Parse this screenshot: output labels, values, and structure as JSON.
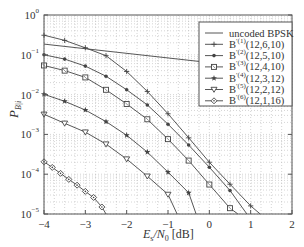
{
  "chart_data": {
    "type": "line",
    "title": "",
    "xlabel": "E_s/N_0 [dB]",
    "ylabel": "P_{B|i}",
    "xlim": [
      -4,
      2
    ],
    "ylim": [
      1e-05,
      1
    ],
    "yscale": "log",
    "grid": true,
    "legend_position": "upper right",
    "x_ticks": [
      "-4",
      "-3",
      "-2",
      "-1",
      "0",
      "1",
      "2"
    ],
    "y_ticks": [
      "10^0",
      "10^-1",
      "10^-2",
      "10^-3",
      "10^-4",
      "10^-5"
    ],
    "series": [
      {
        "name": "uncoded BPSK",
        "marker": "none",
        "x": [
          -4,
          2
        ],
        "y": [
          0.186,
          0.0375
        ]
      },
      {
        "name": "B^(1)(12,6,10)",
        "sup": "(1)",
        "code": "(12,6,10)",
        "marker": "plus",
        "x": [
          -4,
          -3.5,
          -3,
          -2.5,
          -2,
          -1.5,
          -1,
          -0.5,
          0,
          0.5,
          1,
          1.23
        ],
        "y": [
          0.31,
          0.23,
          0.15,
          0.095,
          0.038,
          0.012,
          0.0033,
          0.00082,
          0.0002,
          5.6e-05,
          1.6e-05,
          1e-05
        ]
      },
      {
        "name": "B^(2)(12,5,10)",
        "sup": "(2)",
        "code": "(12,5,10)",
        "marker": "star-small",
        "x": [
          -4,
          -3.5,
          -3,
          -2.5,
          -2,
          -1.5,
          -1,
          -0.5,
          0,
          0.5,
          0.91
        ],
        "y": [
          0.1,
          0.078,
          0.052,
          0.029,
          0.0132,
          0.0055,
          0.0018,
          0.00054,
          0.00015,
          3.9e-05,
          1e-05
        ]
      },
      {
        "name": "B^(3)(12,4,10)",
        "sup": "(3)",
        "code": "(12,4,10)",
        "marker": "square",
        "x": [
          -4,
          -3.5,
          -3,
          -2.5,
          -2,
          -1.5,
          -1,
          -0.5,
          0,
          0.5,
          0.69
        ],
        "y": [
          0.054,
          0.04,
          0.027,
          0.0132,
          0.0058,
          0.0024,
          0.00076,
          0.00022,
          5.5e-05,
          1.4e-05,
          1e-05
        ]
      },
      {
        "name": "B^(4)(12,3,12)",
        "sup": "(4)",
        "code": "(12,3,12)",
        "marker": "star",
        "x": [
          -4,
          -3.5,
          -3,
          -2.5,
          -2,
          -1.5,
          -1,
          -0.5,
          -0.32
        ],
        "y": [
          0.0102,
          0.0068,
          0.0041,
          0.0021,
          0.00095,
          0.00036,
          0.000113,
          3.4e-05,
          1e-05
        ]
      },
      {
        "name": "B^(5)(12,2,12)",
        "sup": "(5)",
        "code": "(12,2,12)",
        "marker": "triangle-down",
        "x": [
          -4,
          -3.5,
          -3,
          -2.5,
          -2,
          -1.5,
          -1,
          -0.78
        ],
        "y": [
          0.0032,
          0.0019,
          0.00114,
          0.00057,
          0.00024,
          8.9e-05,
          3.1e-05,
          1e-05
        ]
      },
      {
        "name": "B^(6)(12,1,16)",
        "sup": "(6)",
        "code": "(12,1,16)",
        "marker": "diamond",
        "x": [
          -4,
          -3.8,
          -3.6,
          -3.4,
          -3.2,
          -3.0,
          -2.8,
          -2.6,
          -2.5
        ],
        "y": [
          0.000205,
          0.000148,
          0.000105,
          7.4e-05,
          5.3e-05,
          3.7e-05,
          2.6e-05,
          1.5e-05,
          1e-05
        ]
      }
    ]
  },
  "axes": {
    "xlabel_main": "E",
    "xlabel_sub1": "s",
    "xlabel_mid": "/N",
    "xlabel_sub2": "0",
    "xlabel_unit": " [dB]",
    "ylabel_main": "P",
    "ylabel_sub": "B|i"
  },
  "legend": {
    "items": [
      {
        "prefix": "",
        "label": "uncoded BPSK"
      },
      {
        "prefix": "B",
        "sup": "(1)",
        "label": "(12,6,10)"
      },
      {
        "prefix": "B",
        "sup": "(2)",
        "label": "(12,5,10)"
      },
      {
        "prefix": "B",
        "sup": "(3)",
        "label": "(12,4,10)"
      },
      {
        "prefix": "B",
        "sup": "(4)",
        "label": "(12,3,12)"
      },
      {
        "prefix": "B",
        "sup": "(5)",
        "label": "(12,2,12)"
      },
      {
        "prefix": "B",
        "sup": "(6)",
        "label": "(12,1,16)"
      }
    ]
  },
  "colors": {
    "line": "#444444",
    "grid": "#b8b8b8",
    "frame": "#555555",
    "text": "#333333"
  }
}
